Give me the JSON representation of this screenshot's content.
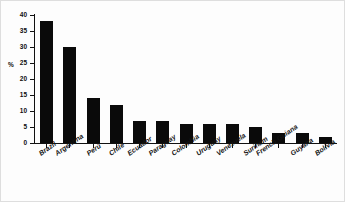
{
  "chart_data": {
    "type": "bar",
    "title": "",
    "subtitle": "",
    "xlabel": "",
    "ylabel": "%",
    "ylim": [
      0,
      40
    ],
    "ytick_step": 5,
    "yticks": [
      40,
      35,
      30,
      25,
      20,
      15,
      10,
      5,
      0
    ],
    "grid": false,
    "legend": "none",
    "bar_color": "#0a0a0a",
    "axis_color": "#111111",
    "background": "#fdfdfd",
    "categories": [
      "Brazil",
      "Argentina",
      "Perú",
      "Chile",
      "Ecuador",
      "Paraguay",
      "Colombia",
      "Uruguay",
      "Venezuela",
      "Surinam",
      "French Guiana",
      "Guyana",
      "Bolivia"
    ],
    "values": [
      38,
      30,
      14,
      12,
      7,
      7,
      6,
      6,
      6,
      5,
      3,
      3,
      2
    ]
  }
}
